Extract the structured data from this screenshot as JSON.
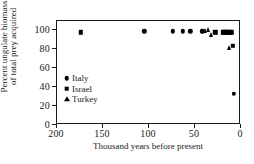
{
  "chart_data": {
    "type": "scatter",
    "title": "",
    "xlabel": "Thousand years before present",
    "ylabel": "Percent ungulate biomass of total prey acquired",
    "ylabel_line1": "Percent ungulate biomass",
    "ylabel_line2": "of total prey acquired",
    "xlim": [
      200,
      0
    ],
    "ylim": [
      0,
      110
    ],
    "x_axis_reversed": true,
    "grid": false,
    "legend_position": "center-left",
    "xticks": [
      200,
      150,
      100,
      50,
      0
    ],
    "yticks": [
      0,
      20,
      40,
      60,
      80,
      100
    ],
    "xticklabels": [
      "200",
      "150",
      "100",
      "50",
      "0"
    ],
    "yticklabels": [
      "0",
      "20",
      "40",
      "60",
      "80",
      "100"
    ],
    "series": [
      {
        "name": "Italy",
        "marker": "circle",
        "color": "#000000",
        "points": [
          {
            "x": 104,
            "y": 98
          },
          {
            "x": 73,
            "y": 98
          },
          {
            "x": 62,
            "y": 98
          },
          {
            "x": 54,
            "y": 98
          },
          {
            "x": 41,
            "y": 98
          },
          {
            "x": 7,
            "y": 32
          }
        ]
      },
      {
        "name": "Israel",
        "marker": "square",
        "color": "#000000",
        "points": [
          {
            "x": 173,
            "y": 97
          },
          {
            "x": 27,
            "y": 97
          },
          {
            "x": 19,
            "y": 97
          },
          {
            "x": 17,
            "y": 97
          },
          {
            "x": 15,
            "y": 97
          },
          {
            "x": 13,
            "y": 97
          },
          {
            "x": 11,
            "y": 97
          },
          {
            "x": 9,
            "y": 97
          },
          {
            "x": 8,
            "y": 83
          }
        ]
      },
      {
        "name": "Turkey",
        "marker": "triangle",
        "color": "#000000",
        "points": [
          {
            "x": 38,
            "y": 98
          },
          {
            "x": 35,
            "y": 99
          },
          {
            "x": 31,
            "y": 94
          },
          {
            "x": 12,
            "y": 80
          }
        ]
      }
    ],
    "legend": [
      {
        "label": "Italy",
        "marker": "circle"
      },
      {
        "label": "Israel",
        "marker": "square"
      },
      {
        "label": "Turkey",
        "marker": "triangle"
      }
    ]
  }
}
